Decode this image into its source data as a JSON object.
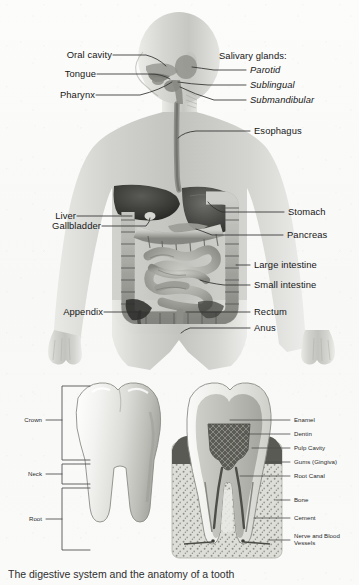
{
  "figure": {
    "caption": "The digestive system and the anatomy of a tooth"
  },
  "body_panel": {
    "name": "digestive-system-diagram",
    "left_labels": [
      {
        "id": "oral-cavity",
        "text": "Oral cavity"
      },
      {
        "id": "tongue",
        "text": "Tongue"
      },
      {
        "id": "pharynx",
        "text": "Pharynx"
      },
      {
        "id": "liver",
        "text": "Liver"
      },
      {
        "id": "gallbladder",
        "text": "Gallbladder"
      },
      {
        "id": "appendix",
        "text": "Appendix"
      }
    ],
    "right_labels": [
      {
        "id": "salivary-glands",
        "text": "Salivary glands:",
        "italic": false
      },
      {
        "id": "parotid",
        "text": "Parotid",
        "italic": true
      },
      {
        "id": "sublingual",
        "text": "Sublingual",
        "italic": true
      },
      {
        "id": "submandibular",
        "text": "Submandibular",
        "italic": true
      },
      {
        "id": "esophagus",
        "text": "Esophagus",
        "italic": false
      },
      {
        "id": "stomach",
        "text": "Stomach",
        "italic": false
      },
      {
        "id": "pancreas",
        "text": "Pancreas",
        "italic": false
      },
      {
        "id": "large-intestine",
        "text": "Large intestine",
        "italic": false
      },
      {
        "id": "small-intestine",
        "text": "Small intestine",
        "italic": false
      },
      {
        "id": "rectum",
        "text": "Rectum",
        "italic": false
      },
      {
        "id": "anus",
        "text": "Anus",
        "italic": false
      }
    ]
  },
  "tooth_panel": {
    "name": "tooth-anatomy-diagram",
    "left_labels": [
      {
        "id": "crown",
        "text": "Crown"
      },
      {
        "id": "neck",
        "text": "Neck"
      },
      {
        "id": "root",
        "text": "Root"
      }
    ],
    "right_labels": [
      {
        "id": "enamel",
        "text": "Enamel"
      },
      {
        "id": "dentin",
        "text": "Dentin"
      },
      {
        "id": "pulp-cavity",
        "text": "Pulp Cavity"
      },
      {
        "id": "gums-gingiva",
        "text": "Gums (Gingiva)"
      },
      {
        "id": "root-canal",
        "text": "Root Canal"
      },
      {
        "id": "bone",
        "text": "Bone"
      },
      {
        "id": "cement",
        "text": "Cement"
      },
      {
        "id": "nerve-and-blood-vessels",
        "text": "Nerve and Blood Vessels"
      }
    ]
  },
  "colors": {
    "background": "#fbfbfa",
    "ink": "#171717",
    "leader_line": "#3a3a3a",
    "figure_gray_light": "#d9d9d6",
    "figure_gray_mid": "#a8a8a4",
    "figure_gray_dark": "#5e5e5b"
  }
}
